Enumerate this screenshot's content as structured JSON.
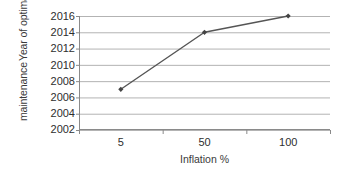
{
  "chart_data": {
    "type": "line",
    "title": "",
    "subtitle": "",
    "xlabel": "Inflation %",
    "ylabel_lines": [
      "Year of optimal",
      "maintenance"
    ],
    "ylabel": "Year of optimal maintenance",
    "categories": [
      "5",
      "50",
      "100"
    ],
    "x": [
      5,
      50,
      100
    ],
    "values": [
      2007,
      2014,
      2016
    ],
    "series": [
      {
        "name": "Year of optimal maintenance",
        "values": [
          2007,
          2014,
          2016
        ]
      }
    ],
    "ylim": [
      2002,
      2016
    ],
    "yticks": [
      2002,
      2004,
      2006,
      2008,
      2010,
      2012,
      2014,
      2016
    ],
    "ytick_labels": [
      "2002",
      "2004",
      "2006",
      "2008",
      "2010",
      "2012",
      "2014",
      "2016"
    ],
    "xtick_labels": [
      "5",
      "50",
      "100"
    ],
    "grid": {
      "horizontal": true,
      "vertical": false
    },
    "legend": {
      "visible": false,
      "position": "none"
    },
    "colors": {
      "line": "#555555",
      "marker": "#444444",
      "gridline": "#b3b3b3",
      "axis": "#808080",
      "text": "#3a3a3a",
      "background": "#ffffff"
    }
  }
}
